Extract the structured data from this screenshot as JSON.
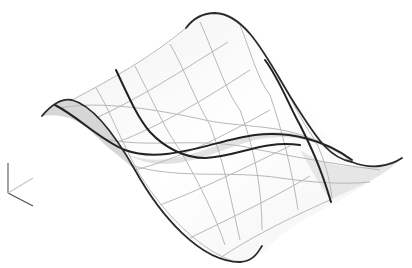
{
  "viewport": {
    "background": "#ffffff",
    "description": "3D wavy surface rendered with isoparametric wireframe"
  },
  "surface": {
    "fill_light": "#ffffff",
    "fill_shadow": "#d8d8d8",
    "grid_color": "#b8b8b8",
    "edge_color": "#2a2a2a",
    "outline": "M42,116 C52,104 62,98 72,100 C95,106 118,140 135,170 C160,215 200,262 240,262 C262,260 270,240 300,222 C330,205 370,186 402,158 C390,168 372,170 352,162 C330,150 320,120 300,100 C270,60 250,12 215,13 C200,14 192,22 186,28 C165,50 120,75 42,116 Z",
    "shadow_left": "M42,116 C52,104 62,98 72,100 C95,106 118,140 135,170 C125,160 110,150 100,140 C85,125 70,112 42,116 Z",
    "shadow_mid": "M120,150 C160,175 210,145 250,135 C290,126 320,138 352,162 C320,140 290,132 255,140 C215,150 165,182 120,150 Z",
    "shadow_right": "M300,150 C330,170 370,172 402,158 C380,180 350,190 330,200 C320,185 310,168 300,150 Z",
    "edges": {
      "front_left": "M42,116 C52,104 62,98 72,100 C95,106 118,140 135,170 C160,215 200,262 240,262 C254,261 258,252 262,246",
      "back": "M186,28 C192,20 200,13 215,13 C250,14 272,70 300,112 C318,140 330,158 352,162 C372,170 390,166 402,158",
      "iso_left": "M116,70 C130,100 138,118 150,132 C165,148 185,158 205,158 C240,156 262,140 300,145",
      "iso_right": "M265,60 C280,80 290,108 300,125 C310,145 320,165 331,202",
      "iso_mid": "M55,105 C80,118 100,140 125,150 C165,165 215,140 255,135 C290,131 325,140 352,160"
    },
    "grid_lines": [
      "M72,100 C110,80 150,58 186,28",
      "M96,118 C140,98 180,72 228,42",
      "M118,142 C160,126 200,102 250,70",
      "M135,170 C180,158 220,138 270,110",
      "M160,205 C200,190 240,170 290,146",
      "M190,238 C230,218 270,200 310,176",
      "M220,258 C250,238 285,220 330,200",
      "M96,88 C110,110 120,140 140,175 C165,215 200,250 235,262",
      "M135,66 C150,95 165,130 180,150 C200,185 215,215 225,245",
      "M170,44 C185,70 195,100 210,125 C225,165 232,205 240,240",
      "M200,22 C215,55 225,90 240,110 C255,150 262,190 262,230",
      "M240,25 C250,50 258,80 270,95 C282,130 292,170 298,210",
      "M275,70 C290,95 300,120 315,140 C325,160 330,180 332,198",
      "M60,108 C100,100 160,110 205,120 C250,130 300,120 352,162",
      "M100,138 C150,150 200,135 260,150 C300,158 340,165 380,170",
      "M130,165 C180,180 230,170 280,178 C310,182 340,185 370,182"
    ]
  },
  "axis_triad": {
    "vertical": {
      "x1": 8,
      "y1": 163,
      "x2": 8,
      "y2": 193,
      "color": "#7a7a7a"
    },
    "x_axis": {
      "x1": 8,
      "y1": 193,
      "x2": 33,
      "y2": 206,
      "color": "#555555"
    },
    "y_axis": {
      "x1": 8,
      "y1": 193,
      "x2": 33,
      "y2": 178,
      "color": "#c8c8c8"
    }
  }
}
